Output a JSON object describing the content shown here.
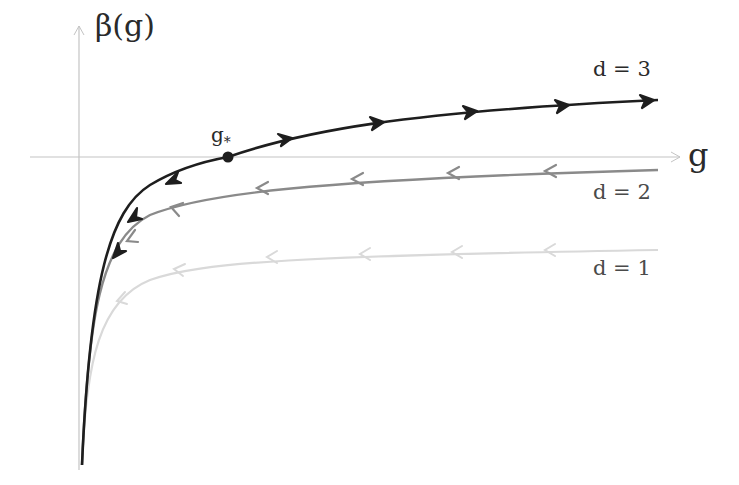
{
  "diagram": {
    "title": "",
    "axes": {
      "y_label": "β(g)",
      "x_label": "g",
      "axis_color": "#c4c4c4"
    },
    "fixed_point": {
      "label": "g",
      "subscript": "*",
      "full_label": "g*",
      "color": "#1e1e1e"
    },
    "curves": [
      {
        "label": "d = 3",
        "color": "#1e1e1e",
        "flow": "away from fixed point (right: toward +g, left: toward 0)"
      },
      {
        "label": "d = 2",
        "color": "#8a8a8a",
        "flow": "toward g = 0"
      },
      {
        "label": "d = 1",
        "color": "#d9d9d9",
        "flow": "toward g = 0"
      }
    ]
  }
}
